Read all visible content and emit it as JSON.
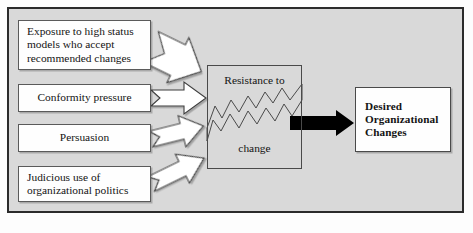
{
  "diagram": {
    "background_color": "#d9d9d9",
    "frame_border_color": "#2b2b2b",
    "box_fill_color": "#fefefe",
    "box_border_color": "#5a5a5a",
    "outline_arrow_fill": "#ffffff",
    "outline_arrow_stroke": "#3d3d3d",
    "solid_arrow_color": "#000000"
  },
  "sources": [
    {
      "id": "exposure",
      "label": "Exposure to high status\nmodels who accept\nrecommended changes",
      "align": "left"
    },
    {
      "id": "conformity",
      "label": "Conformity pressure",
      "align": "center"
    },
    {
      "id": "persuasion",
      "label": "Persuasion",
      "align": "center"
    },
    {
      "id": "judicious",
      "label": "Judicious use of\norganizational politics",
      "align": "left"
    }
  ],
  "resistance": {
    "label_top": "Resistance to",
    "label_bottom": "change",
    "state": "cracked"
  },
  "outcome": {
    "label": "Desired\nOrganizational\nChanges"
  },
  "connectors": [
    {
      "id": "arrow-exposure-to-resistance",
      "style": "outline",
      "direction": "down-right"
    },
    {
      "id": "arrow-conformity-to-resistance",
      "style": "outline",
      "direction": "right"
    },
    {
      "id": "arrow-persuasion-to-resistance",
      "style": "outline",
      "direction": "up-right"
    },
    {
      "id": "arrow-judicious-to-resistance",
      "style": "outline",
      "direction": "up-right"
    },
    {
      "id": "arrow-resistance-to-outcome",
      "style": "solid",
      "direction": "right"
    }
  ]
}
